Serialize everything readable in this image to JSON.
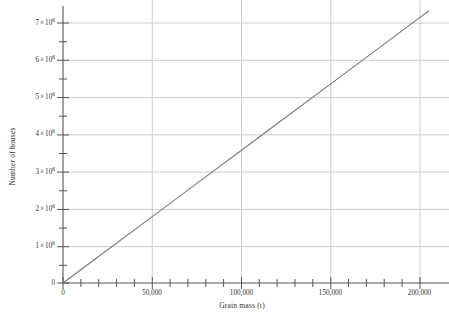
{
  "chart_data": {
    "type": "line",
    "title": "",
    "xlabel": "Grain mass (t)",
    "ylabel": "Number of houses",
    "xlim": [
      0,
      205000
    ],
    "ylim": [
      0,
      7400000
    ],
    "grid": true,
    "legend": "none",
    "x_ticks": [
      {
        "value": 0,
        "label": "0"
      },
      {
        "value": 50000,
        "label": "50,000"
      },
      {
        "value": 100000,
        "label": "100,000"
      },
      {
        "value": 150000,
        "label": "150,000"
      },
      {
        "value": 200000,
        "label": "200,000"
      }
    ],
    "y_ticks": [
      {
        "value": 0,
        "mantissa": "0",
        "exponent": ""
      },
      {
        "value": 1000000,
        "mantissa": "1",
        "exponent": "6"
      },
      {
        "value": 2000000,
        "mantissa": "2",
        "exponent": "6"
      },
      {
        "value": 3000000,
        "mantissa": "3",
        "exponent": "6"
      },
      {
        "value": 4000000,
        "mantissa": "4",
        "exponent": "6"
      },
      {
        "value": 5000000,
        "mantissa": "5",
        "exponent": "6"
      },
      {
        "value": 6000000,
        "mantissa": "6",
        "exponent": "6"
      },
      {
        "value": 7000000,
        "mantissa": "7",
        "exponent": "6"
      }
    ],
    "y_tick_multiplier_symbol": "×",
    "y_tick_base": "10",
    "series": [
      {
        "name": "Number of houses vs grain mass",
        "color": "#7a7a7a",
        "x": [
          0,
          25000,
          50000,
          75000,
          100000,
          125000,
          150000,
          175000,
          200000,
          205000
        ],
        "values": [
          0,
          893750,
          1787500,
          2681250,
          3575000,
          4468750,
          5362500,
          6256250,
          7150000,
          7328750
        ]
      }
    ],
    "slope_houses_per_tonne": 35.75,
    "annotations": []
  },
  "axes": {
    "line_color": "#555555",
    "grid_color": "#cccccc",
    "background": "#ffffff"
  }
}
